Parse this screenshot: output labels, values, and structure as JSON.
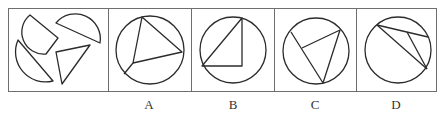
{
  "figure": {
    "type": "spatial-reasoning-puzzle",
    "stroke_color": "#2b2b2b",
    "frame_color": "#6e6e6e"
  },
  "question_panel": {
    "pieces": [
      "circle-segment-1",
      "circle-segment-2",
      "circle-segment-3",
      "triangle"
    ]
  },
  "options": [
    {
      "label": "A",
      "description": "circle with inscribed triangle plus chord to an interior vertex"
    },
    {
      "label": "B",
      "description": "circle with right triangle, hypotenuse as chord"
    },
    {
      "label": "C",
      "description": "circle with triangle having one interior vertex"
    },
    {
      "label": "D",
      "description": "circle with chord and thin triangle inside"
    }
  ]
}
